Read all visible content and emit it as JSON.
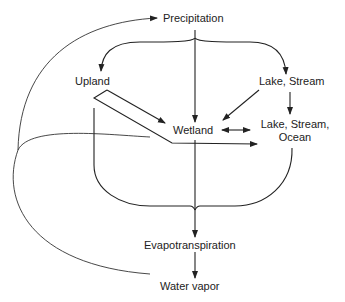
{
  "diagram": {
    "type": "water-cycle-flow",
    "nodes": {
      "precipitation": "Precipitation",
      "upland": "Upland",
      "lake_stream_top": "Lake, Stream",
      "wetland": "Wetland",
      "lake_stream_ocean_line1": "Lake, Stream,",
      "lake_stream_ocean_line2": "Ocean",
      "evapotranspiration": "Evapotranspiration",
      "water_vapor": "Water vapor"
    },
    "edges": [
      {
        "from": "Precipitation",
        "to": "Upland"
      },
      {
        "from": "Precipitation",
        "to": "Wetland"
      },
      {
        "from": "Precipitation",
        "to": "Lake, Stream"
      },
      {
        "from": "Upland",
        "to": "Wetland"
      },
      {
        "from": "Upland",
        "to": "Lake, Stream, Ocean"
      },
      {
        "from": "Lake, Stream",
        "to": "Wetland"
      },
      {
        "from": "Lake, Stream",
        "to": "Lake, Stream, Ocean"
      },
      {
        "from": "Wetland",
        "to": "Lake, Stream, Ocean",
        "bidirectional": true
      },
      {
        "from": "Upland",
        "to": "Evapotranspiration"
      },
      {
        "from": "Wetland",
        "to": "Evapotranspiration"
      },
      {
        "from": "Lake, Stream, Ocean",
        "to": "Evapotranspiration"
      },
      {
        "from": "Evapotranspiration",
        "to": "Water vapor"
      },
      {
        "from": "Water vapor",
        "to": "Precipitation"
      }
    ],
    "colors": {
      "stroke": "#222222",
      "background": "#ffffff"
    }
  }
}
